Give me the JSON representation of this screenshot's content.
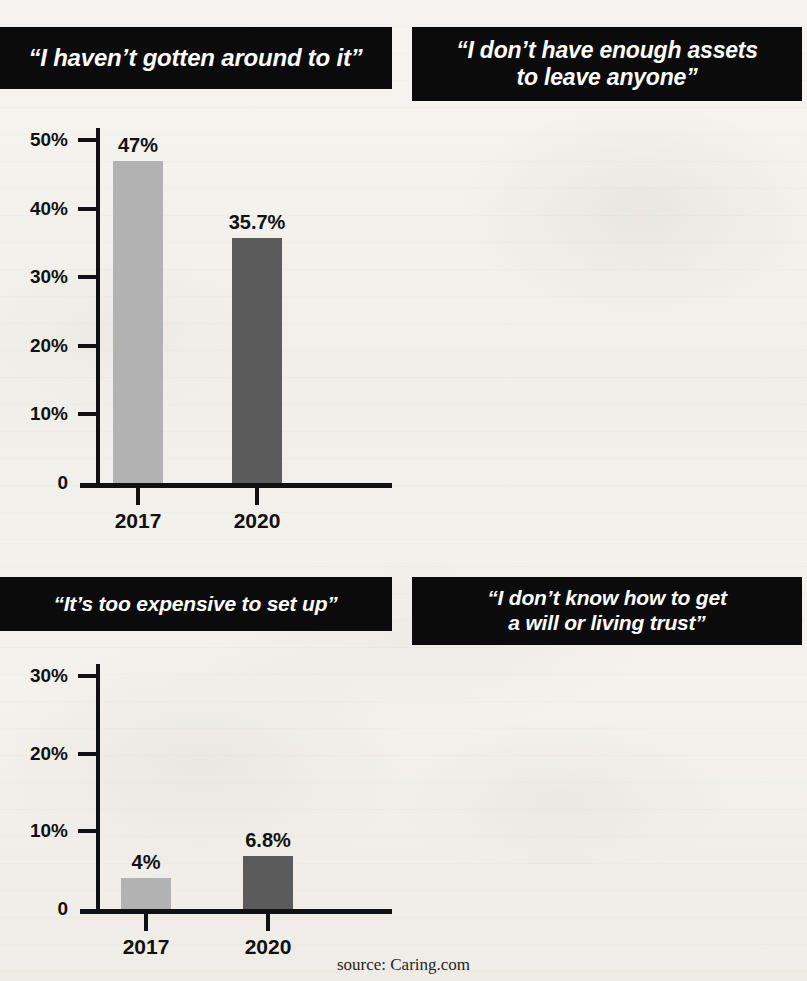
{
  "source_note": "source: Caring.com",
  "colors": {
    "bar_2017": "#b2b2b2",
    "bar_2020": "#5b5b5b",
    "banner_bg": "#0b0b0b",
    "banner_text": "#ffffff",
    "paper": "#f3f1ec",
    "axis": "#111111"
  },
  "chart_data": [
    {
      "type": "bar",
      "title": "“I haven’t gotten around to it”",
      "categories": [
        "2017",
        "2020"
      ],
      "values": [
        47,
        35.7
      ],
      "value_labels": [
        "47%",
        "35.7%"
      ],
      "ylabel": "",
      "xlabel": "",
      "ylim": [
        0,
        50
      ],
      "yticks": [
        0,
        10,
        20,
        30,
        40,
        50
      ],
      "ytick_labels": [
        "0",
        "10%",
        "20%",
        "30%",
        "40%",
        "50%"
      ],
      "grid": false,
      "legend": "none"
    },
    {
      "type": "bar",
      "title": "“I don’t have enough assets to leave anyone”",
      "title_lines": [
        "“I don’t have enough assets",
        "to leave anyone”"
      ],
      "categories": [
        "2017",
        "2020"
      ],
      "values": [
        29,
        30.4
      ],
      "value_labels": [
        "29%",
        "30.4%"
      ],
      "ylabel": "",
      "xlabel": "",
      "ylim": [
        0,
        50
      ],
      "yticks": [
        0,
        10,
        20,
        30,
        40,
        50
      ],
      "ytick_labels": [
        "0",
        "10%",
        "20%",
        "30%",
        "40%",
        "50%"
      ],
      "grid": false,
      "legend": "none"
    },
    {
      "type": "bar",
      "title": "“It’s too expensive to set up”",
      "categories": [
        "2017",
        "2020"
      ],
      "values": [
        4,
        6.8
      ],
      "value_labels": [
        "4%",
        "6.8%"
      ],
      "ylabel": "",
      "xlabel": "",
      "ylim": [
        0,
        30
      ],
      "yticks": [
        0,
        10,
        20,
        30
      ],
      "ytick_labels": [
        "0",
        "10%",
        "20%",
        "30%"
      ],
      "grid": false,
      "legend": "none"
    },
    {
      "type": "bar",
      "title": "“I don’t know how to get a will or living trust”",
      "title_lines": [
        "“I don’t know how to get",
        "a will or living trust”"
      ],
      "categories": [
        "2017",
        "2020"
      ],
      "values": [
        4,
        6.3
      ],
      "value_labels": [
        "4%",
        "6.3%"
      ],
      "ylabel": "",
      "xlabel": "",
      "ylim": [
        0,
        30
      ],
      "yticks": [
        0,
        10,
        20,
        30
      ],
      "ytick_labels": [
        "0",
        "10%",
        "20%",
        "30%"
      ],
      "grid": false,
      "legend": "none"
    }
  ]
}
